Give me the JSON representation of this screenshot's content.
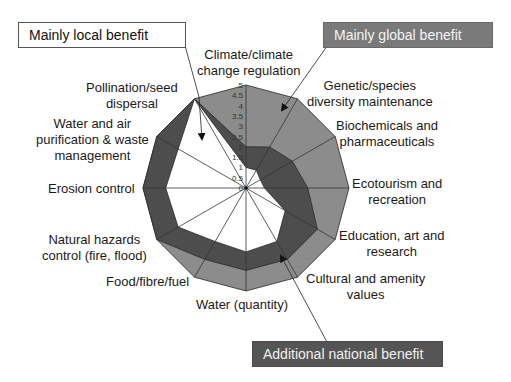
{
  "callouts": {
    "local": "Mainly local benefit",
    "global": "Mainly global benefit",
    "national": "Additional national benefit"
  },
  "colors": {
    "global": "#8c8c8c",
    "national": "#4d4d4d",
    "local": "#ffffff",
    "gridline": "#333333"
  },
  "chart_data": {
    "type": "radar",
    "title": "",
    "categories": [
      "Climate/climate change regulation",
      "Genetic/species diversity maintenance",
      "Biochemicals and pharmaceuticals",
      "Ecotourism and recreation",
      "Education, art and research",
      "Cultural and amenity values",
      "Water (quantity)",
      "Food/fibre/fuel",
      "Natural hazards control (fire, flood)",
      "Erosion control",
      "Water and air purification & waste management",
      "Pollination/seed dispersal"
    ],
    "series": [
      {
        "name": "Mainly global benefit",
        "values": [
          5,
          5,
          5,
          5,
          5,
          5,
          5,
          5,
          5,
          5,
          5,
          5
        ]
      },
      {
        "name": "Additional national benefit",
        "values": [
          2.0,
          2.3,
          2.6,
          3.0,
          4.0,
          4.0,
          4.0,
          4.0,
          5.0,
          5.0,
          5.0,
          5.0
        ]
      },
      {
        "name": "Mainly local benefit",
        "values": [
          1.0,
          1.0,
          0.8,
          0.9,
          2.2,
          3.0,
          3.1,
          3.0,
          3.8,
          3.9,
          3.8,
          5.0
        ]
      }
    ],
    "radial_ticks": [
      "0",
      "0.5",
      "1",
      "1.5",
      "2",
      "2.5",
      "3",
      "3.5",
      "4",
      "4.5",
      "5"
    ],
    "rlim": [
      0,
      5
    ],
    "grid": false,
    "legend_position": "callouts"
  },
  "labels": [
    {
      "text": "Climate/climate\nchange regulation",
      "x": 197,
      "y": 47,
      "align": "center"
    },
    {
      "text": "Genetic/species\ndiversity maintenance",
      "x": 307,
      "y": 78,
      "align": "center"
    },
    {
      "text": "Biochemicals and\npharmaceuticals",
      "x": 336,
      "y": 118,
      "align": "center"
    },
    {
      "text": "Ecotourism and\nrecreation",
      "x": 352,
      "y": 176,
      "align": "center"
    },
    {
      "text": "Education, art and\nresearch",
      "x": 339,
      "y": 228,
      "align": "center"
    },
    {
      "text": "Cultural and amenity\nvalues",
      "x": 306,
      "y": 271,
      "align": "center"
    },
    {
      "text": "Water (quantity)",
      "x": 196,
      "y": 297,
      "align": "left"
    },
    {
      "text": "Food/fibre/fuel",
      "x": 106,
      "y": 274,
      "align": "left"
    },
    {
      "text": "Natural hazards\ncontrol (fire, flood)",
      "x": 42,
      "y": 232,
      "align": "center"
    },
    {
      "text": "Erosion control",
      "x": 48,
      "y": 181,
      "align": "left"
    },
    {
      "text": "Water and air\npurification & waste\nmanagement",
      "x": 36,
      "y": 116,
      "align": "center"
    },
    {
      "text": "Pollination/seed\ndispersal",
      "x": 86,
      "y": 80,
      "align": "center"
    }
  ]
}
